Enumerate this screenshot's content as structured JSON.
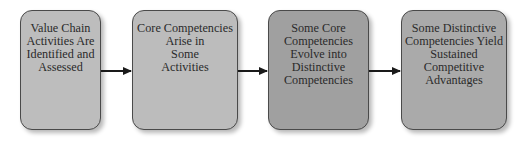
{
  "diagram": {
    "type": "flowchart",
    "direction": "left-to-right",
    "nodes": [
      {
        "id": "n1",
        "lines": [
          "Value Chain",
          "Activities Are",
          "Identified and",
          "Assessed"
        ],
        "fill": "#bdbdbd"
      },
      {
        "id": "n2",
        "lines": [
          "Core Competencies",
          "Arise in",
          "Some",
          "Activities"
        ],
        "fill": "#bcbcbc"
      },
      {
        "id": "n3",
        "lines": [
          "Some Core",
          "Competencies",
          "Evolve into",
          "Distinctive",
          "Competencies"
        ],
        "fill": "#a0a0a0"
      },
      {
        "id": "n4",
        "lines": [
          "Some Distinctive",
          "Competencies Yield",
          "Sustained",
          "Competitive",
          "Advantages"
        ],
        "fill": "#aaaaaa"
      }
    ],
    "edges": [
      {
        "from": "n1",
        "to": "n2"
      },
      {
        "from": "n2",
        "to": "n3"
      },
      {
        "from": "n3",
        "to": "n4"
      }
    ],
    "colors": {
      "border": "#4a4a4a",
      "arrow": "#1a1a1a",
      "text": "#2a2a2a",
      "background": "#ffffff"
    }
  }
}
